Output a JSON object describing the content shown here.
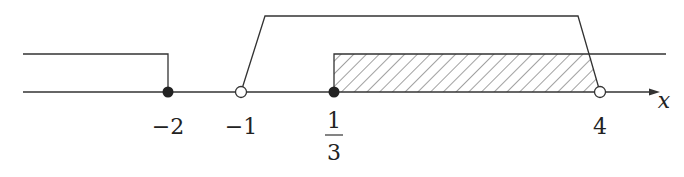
{
  "diagram": {
    "type": "number-line",
    "axis_label": "x",
    "points": [
      {
        "value": -2,
        "label": "−2",
        "marker": "filled"
      },
      {
        "value": -1,
        "label": "−1",
        "marker": "open"
      },
      {
        "value": "1/3",
        "numerator": "1",
        "denominator": "3",
        "marker": "filled"
      },
      {
        "value": 4,
        "label": "4",
        "marker": "open"
      }
    ],
    "regions": [
      {
        "name": "x ≤ −2",
        "from": "-inf",
        "to": -2,
        "level": "middle"
      },
      {
        "name": "−1 < x < 4",
        "from": -1,
        "to": 4,
        "level": "top",
        "shape": "trapezoid"
      },
      {
        "name": "x ≥ 1/3",
        "from": "1/3",
        "to": "+inf",
        "level": "middle"
      },
      {
        "name": "solution 1/3 ≤ x < 4",
        "from": "1/3",
        "to": 4,
        "hatched": true
      }
    ],
    "colors": {
      "line": "#333333",
      "background": "#ffffff"
    }
  }
}
